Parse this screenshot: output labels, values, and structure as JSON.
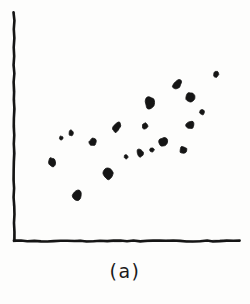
{
  "figure": {
    "caption": "(a)",
    "kind": "hand-drawn scatter plot",
    "ink_color": "#151515",
    "background_color": "#fdfdfc"
  },
  "axes": {
    "y_axis": {
      "x": 14,
      "y_top": 12,
      "y_bottom": 241
    },
    "x_axis": {
      "y": 241,
      "x_left": 14,
      "x_right": 240
    },
    "tick_labels_x": [],
    "tick_labels_y": [],
    "grid": false
  },
  "chart_data": {
    "type": "scatter",
    "title": "",
    "subtitle": "",
    "xlabel": "",
    "ylabel": "",
    "annotations": [
      "(a)"
    ],
    "legend": [],
    "legend_position": "none",
    "grid": false,
    "xlim": [
      14,
      240
    ],
    "ylim": [
      241,
      12
    ],
    "correlation": "positive",
    "n_points": 19,
    "series": [
      {
        "name": "points",
        "marker": "ink-blob",
        "color": "#151515",
        "points": [
          {
            "x": 52,
            "y": 162,
            "rx": 4.0,
            "ry": 4.6,
            "rot": -18
          },
          {
            "x": 77,
            "y": 195,
            "rx": 4.2,
            "ry": 5.0,
            "rot": 12
          },
          {
            "x": 71,
            "y": 133,
            "rx": 2.2,
            "ry": 2.8,
            "rot": 0
          },
          {
            "x": 93,
            "y": 142,
            "rx": 3.6,
            "ry": 3.8,
            "rot": 25
          },
          {
            "x": 108,
            "y": 174,
            "rx": 5.0,
            "ry": 5.4,
            "rot": -10
          },
          {
            "x": 117,
            "y": 127,
            "rx": 3.2,
            "ry": 5.8,
            "rot": 35
          },
          {
            "x": 140,
            "y": 153,
            "rx": 3.0,
            "ry": 4.6,
            "rot": -8
          },
          {
            "x": 145,
            "y": 126,
            "rx": 2.8,
            "ry": 3.4,
            "rot": 15
          },
          {
            "x": 150,
            "y": 103,
            "rx": 4.8,
            "ry": 6.2,
            "rot": -5
          },
          {
            "x": 163,
            "y": 142,
            "rx": 4.4,
            "ry": 4.8,
            "rot": 20
          },
          {
            "x": 152,
            "y": 150,
            "rx": 2.0,
            "ry": 2.4,
            "rot": 0
          },
          {
            "x": 177,
            "y": 85,
            "rx": 3.6,
            "ry": 5.6,
            "rot": 40
          },
          {
            "x": 190,
            "y": 97,
            "rx": 4.2,
            "ry": 4.8,
            "rot": -15
          },
          {
            "x": 190,
            "y": 125,
            "rx": 4.0,
            "ry": 4.4,
            "rot": 18
          },
          {
            "x": 202,
            "y": 112,
            "rx": 2.6,
            "ry": 3.0,
            "rot": 0
          },
          {
            "x": 183,
            "y": 150,
            "rx": 3.4,
            "ry": 4.0,
            "rot": -22
          },
          {
            "x": 216,
            "y": 74,
            "rx": 2.4,
            "ry": 3.2,
            "rot": 10
          },
          {
            "x": 126,
            "y": 157,
            "rx": 1.9,
            "ry": 2.3,
            "rot": 0
          },
          {
            "x": 61,
            "y": 138,
            "rx": 1.8,
            "ry": 2.2,
            "rot": 0
          }
        ]
      }
    ]
  }
}
